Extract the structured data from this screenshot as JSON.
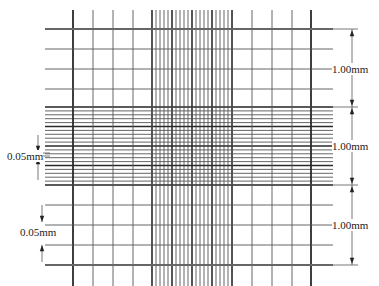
{
  "diagram": {
    "colors": {
      "line": "#2a2a2a",
      "thin_line": "#555555",
      "background": "#ffffff"
    },
    "grid": {
      "vertical_major_x": [
        73,
        93,
        113,
        133,
        152,
        232,
        252,
        272,
        292,
        311
      ],
      "horizontal_major_y": [
        29,
        49,
        69,
        89,
        107,
        185,
        205,
        225,
        245,
        265
      ],
      "dense_band_x": [
        152,
        232
      ],
      "dense_band_y": [
        107,
        185
      ],
      "dense_subdivisions": 20,
      "line_extent_y": [
        10,
        286
      ],
      "line_extent_x": [
        45,
        333
      ]
    },
    "labels": {
      "right_top": "1.00mm",
      "right_middle": "1.00mm",
      "right_bottom": "1.00mm",
      "left_upper": "0.05mm",
      "left_lower": "0.05mm"
    },
    "dimension_arrows": [
      {
        "side": "right",
        "from_y": 29,
        "to_y": 107,
        "label_key": "right_top"
      },
      {
        "side": "right",
        "from_y": 107,
        "to_y": 185,
        "label_key": "right_middle"
      },
      {
        "side": "right",
        "from_y": 185,
        "to_y": 265,
        "label_key": "right_bottom"
      },
      {
        "side": "left",
        "at_y": 155,
        "label_key": "left_upper"
      },
      {
        "side": "left",
        "at_y": 225,
        "label_key": "left_lower"
      }
    ]
  }
}
